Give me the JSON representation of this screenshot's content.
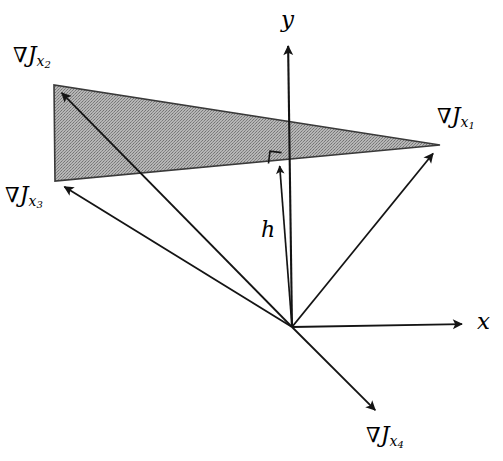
{
  "figure": {
    "type": "vector-diagram",
    "title": "",
    "background_color": "#ffffff",
    "stroke_color": "#1a1a1a",
    "shade_color": "#a0a0a0",
    "width": 503,
    "height": 461
  },
  "axes": {
    "origin": {
      "x": 292,
      "y": 327
    },
    "x_axis": {
      "label": "x",
      "label_x": 477,
      "label_y": 310,
      "tip": {
        "x": 470,
        "y": 324
      }
    },
    "y_axis": {
      "label": "y",
      "label_x": 281,
      "label_y": 8,
      "tip": {
        "x": 288,
        "y": 38
      }
    }
  },
  "vectors": [
    {
      "name": "grad-j-x1",
      "nabla": "∇",
      "base": "J",
      "sub": "x",
      "subsub": "1",
      "tip": {
        "x": 440,
        "y": 145
      },
      "label_x": 437,
      "label_y": 105
    },
    {
      "name": "grad-j-x2",
      "nabla": "∇",
      "base": "J",
      "sub": "x",
      "subsub": "2",
      "tip": {
        "x": 54,
        "y": 85
      },
      "label_x": 13,
      "label_y": 44
    },
    {
      "name": "grad-j-x3",
      "nabla": "∇",
      "base": "J",
      "sub": "x",
      "subsub": "3",
      "tip": {
        "x": 55,
        "y": 181
      },
      "label_x": 5,
      "label_y": 184
    },
    {
      "name": "grad-j-x4",
      "nabla": "∇",
      "base": "J",
      "sub": "x",
      "subsub": "4",
      "tip": {
        "x": 383,
        "y": 418
      },
      "label_x": 366,
      "label_y": 424
    }
  ],
  "height_vector": {
    "label": "h",
    "label_x": 261,
    "label_y": 219,
    "tip": {
      "x": 279,
      "y": 157
    },
    "right_angle_marker": true
  },
  "shaded_region": {
    "name": "convex-hull-triangle",
    "vertices": [
      {
        "x": 54,
        "y": 85
      },
      {
        "x": 55,
        "y": 181
      },
      {
        "x": 440,
        "y": 145
      }
    ],
    "fill": "#a3a3a3"
  },
  "chart_data": {
    "type": "scatter",
    "title": "",
    "xlabel": "x",
    "ylabel": "y",
    "grid": false,
    "legend": "none",
    "origin_px": [
      292,
      327
    ],
    "series": [
      {
        "name": "∇J_x1",
        "tip_px": [
          440,
          145
        ],
        "vector_px": [
          148,
          -182
        ]
      },
      {
        "name": "∇J_x2",
        "tip_px": [
          54,
          85
        ],
        "vector_px": [
          -238,
          -242
        ]
      },
      {
        "name": "∇J_x3",
        "tip_px": [
          55,
          181
        ],
        "vector_px": [
          -237,
          -146
        ]
      },
      {
        "name": "∇J_x4",
        "tip_px": [
          383,
          418
        ],
        "vector_px": [
          91,
          91
        ]
      },
      {
        "name": "h",
        "tip_px": [
          279,
          157
        ],
        "vector_px": [
          -13,
          -170
        ]
      }
    ],
    "annotations": [
      {
        "text": "x",
        "px": [
          485,
          322
        ]
      },
      {
        "text": "y",
        "px": [
          288,
          22
        ]
      },
      {
        "text": "h",
        "px": [
          268,
          232
        ]
      },
      {
        "text": "∇J_x1",
        "px": [
          468,
          120
        ]
      },
      {
        "text": "∇J_x2",
        "px": [
          50,
          60
        ]
      },
      {
        "text": "∇J_x3",
        "px": [
          33,
          199
        ]
      },
      {
        "text": "∇J_x4",
        "px": [
          398,
          440
        ]
      }
    ]
  }
}
